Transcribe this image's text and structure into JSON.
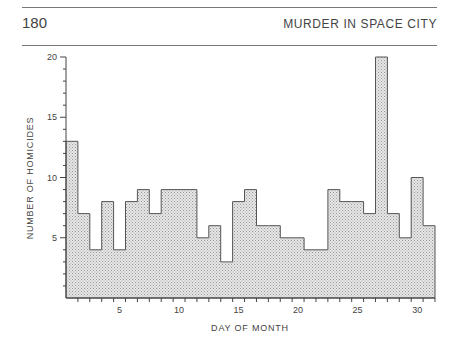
{
  "header": {
    "page_number": "180",
    "running_head": "MURDER IN SPACE CITY"
  },
  "colors": {
    "bar_fill": "#d9d9d9",
    "bar_outline": "#555555",
    "axis": "#444444"
  },
  "chart_data": {
    "type": "bar",
    "title": "",
    "xlabel": "DAY OF MONTH",
    "ylabel": "NUMBER OF HOMICIDES",
    "categories": [
      1,
      2,
      3,
      4,
      5,
      6,
      7,
      8,
      9,
      10,
      11,
      12,
      13,
      14,
      15,
      16,
      17,
      18,
      19,
      20,
      21,
      22,
      23,
      24,
      25,
      26,
      27,
      28,
      29,
      30,
      31
    ],
    "values": [
      13,
      7,
      4,
      8,
      4,
      8,
      9,
      7,
      9,
      9,
      9,
      5,
      6,
      3,
      8,
      9,
      6,
      6,
      5,
      5,
      4,
      4,
      9,
      8,
      8,
      7,
      20,
      7,
      5,
      10,
      6
    ],
    "xticks_labeled": [
      5,
      10,
      15,
      20,
      25,
      30
    ],
    "yticks_labeled": [
      5,
      10,
      15,
      20
    ],
    "ylim": [
      0,
      20
    ],
    "xlim": [
      0.5,
      31.5
    ],
    "grid": false,
    "legend": null,
    "style": "step histogram, stippled gray fill"
  }
}
